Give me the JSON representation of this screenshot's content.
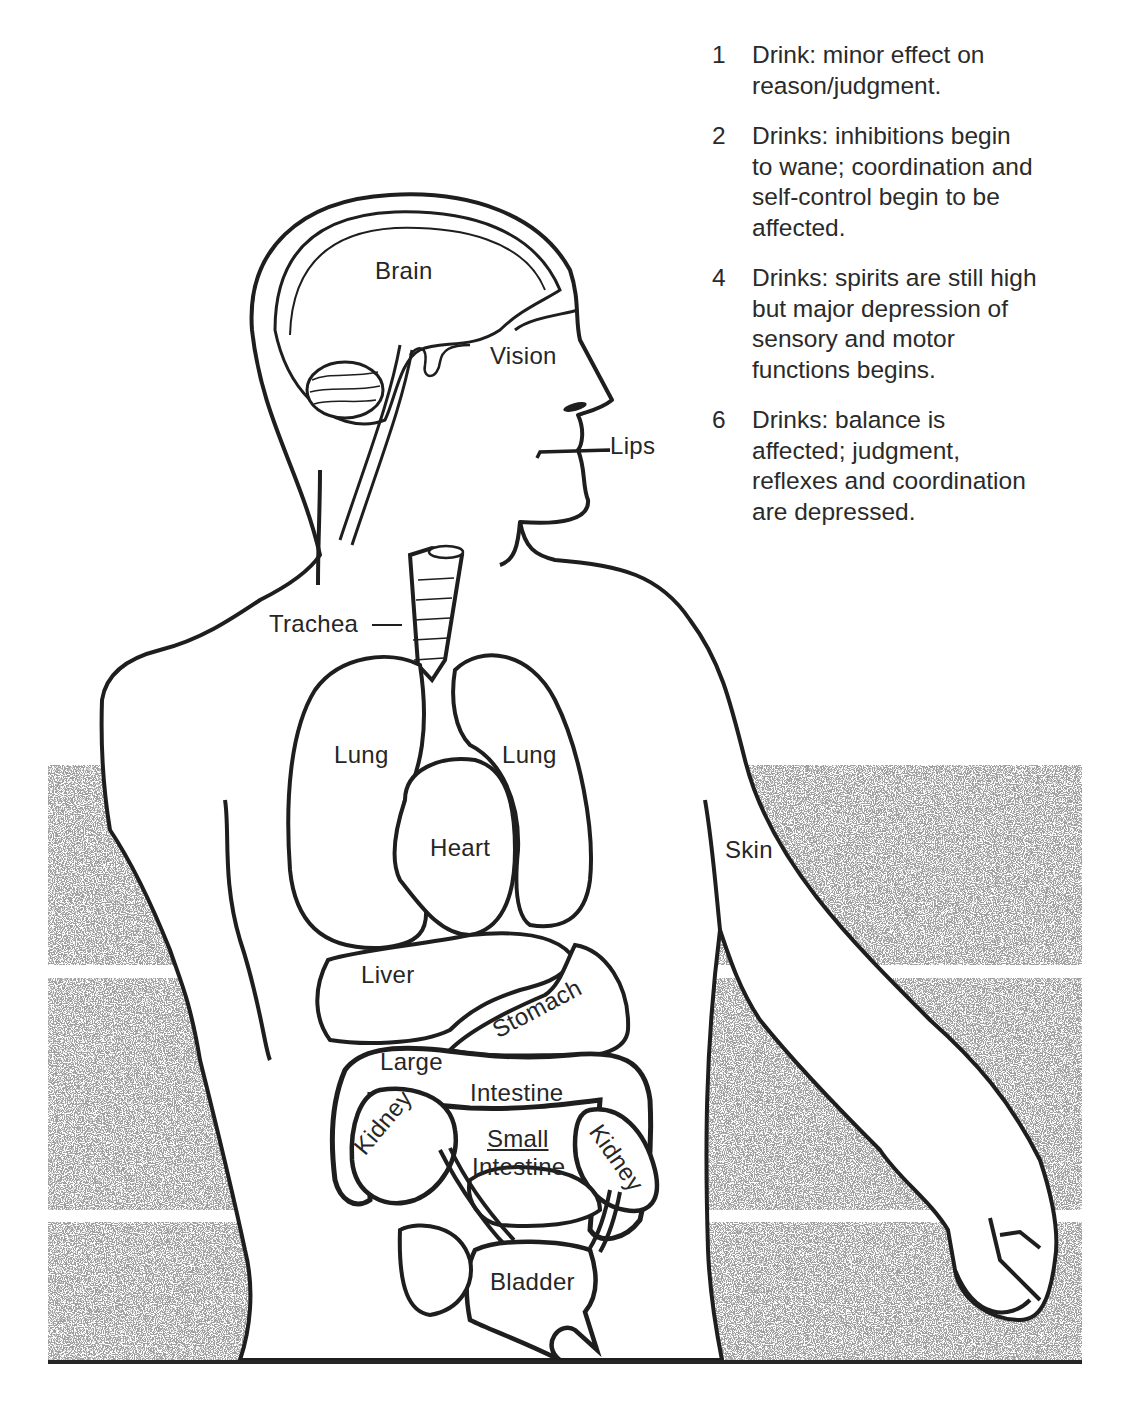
{
  "figure": {
    "stipple_color": "#7a7a7a",
    "line_color": "#1e1e1e"
  },
  "legend": {
    "items": [
      {
        "count": "1",
        "text": "Drink: minor effect on\nreason/judgment."
      },
      {
        "count": "2",
        "text": "Drinks: inhibitions begin\nto wane; coordination and\nself-control begin to be\naffected."
      },
      {
        "count": "4",
        "text": "Drinks: spirits are still high\nbut major depression of\nsensory and motor\nfunctions begins."
      },
      {
        "count": "6",
        "text": "Drinks: balance is\naffected; judgment,\nreflexes and coordination\nare depressed."
      }
    ]
  },
  "labels": {
    "brain": "Brain",
    "vision": "Vision",
    "lips": "Lips",
    "trachea": "Trachea",
    "lung_left": "Lung",
    "lung_right": "Lung",
    "heart": "Heart",
    "skin": "Skin",
    "liver": "Liver",
    "stomach": "Stomach",
    "large_intestine_1": "Large",
    "large_intestine_2": "Intestine",
    "kidney_left": "Kidney",
    "kidney_right": "Kidney",
    "small_intestine_1": "Small",
    "small_intestine_2": "Intestine",
    "bladder": "Bladder"
  },
  "page": {
    "number_clipped": true
  }
}
